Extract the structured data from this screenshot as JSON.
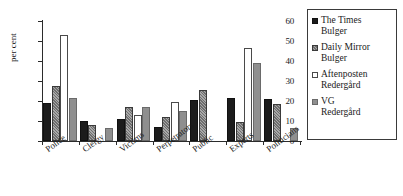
{
  "chart_data": {
    "type": "bar",
    "title": "",
    "xlabel": "",
    "ylabel": "per cent",
    "ylim": [
      0,
      60
    ],
    "yticks": [
      0,
      10,
      20,
      30,
      40,
      50,
      60
    ],
    "grid": false,
    "legend_position": "right",
    "categories": [
      "Police",
      "Clergy",
      "Victims",
      "Perpetrators",
      "Public",
      "Experts",
      "Politicians"
    ],
    "series": [
      {
        "name": "The Times Bulger",
        "values": [
          19.0,
          10.0,
          10.8,
          6.8,
          20.5,
          21.5,
          21.0
        ]
      },
      {
        "name": "Daily Mirror Bulger",
        "values": [
          27.5,
          8.0,
          17.0,
          11.8,
          25.5,
          9.5,
          18.5
        ]
      },
      {
        "name": "Aftenposten Redergård",
        "values": [
          53.0,
          0,
          13.0,
          19.5,
          0,
          46.5,
          0
        ]
      },
      {
        "name": "VG Redergård",
        "values": [
          21.5,
          6.5,
          17.0,
          15.0,
          0,
          39.0,
          6.5
        ]
      }
    ]
  },
  "legend": {
    "entries": [
      {
        "label_line1": "The Times",
        "label_line2": "Bulger",
        "swatch": "black-square-icon"
      },
      {
        "label_line1": "Daily Mirror",
        "label_line2": "Bulger",
        "swatch": "hatched-square-icon"
      },
      {
        "label_line1": "Aftenposten",
        "label_line2": "Redergård",
        "swatch": "white-square-icon"
      },
      {
        "label_line1": "VG",
        "label_line2": "Redergård",
        "swatch": "gray-square-icon"
      }
    ]
  }
}
